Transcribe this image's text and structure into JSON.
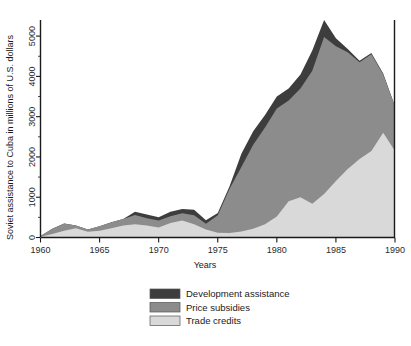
{
  "chart_data": {
    "type": "area",
    "stacked": true,
    "title": "",
    "xlabel": "Years",
    "ylabel": "Soviet assistance to Cuba in millions of U.S. dollars",
    "xlim": [
      1960,
      1990
    ],
    "ylim": [
      0,
      5400
    ],
    "xticks": [
      1960,
      1965,
      1970,
      1975,
      1980,
      1985,
      1990
    ],
    "xtick_labels": [
      "1960",
      "1965",
      "1970",
      "1975",
      "1980",
      "1985",
      "1990"
    ],
    "yticks": [
      0,
      1000,
      2000,
      3000,
      4000,
      5000
    ],
    "ytick_labels": [
      "0",
      "1000",
      "2000",
      "3000",
      "4000",
      "5000"
    ],
    "y_minor_ticks": [
      500,
      1500,
      2500,
      3500,
      4500
    ],
    "grid": false,
    "legend_position": "below-center",
    "x": [
      1960,
      1961,
      1962,
      1963,
      1964,
      1965,
      1966,
      1967,
      1968,
      1969,
      1970,
      1971,
      1972,
      1973,
      1974,
      1975,
      1976,
      1977,
      1978,
      1979,
      1980,
      1981,
      1982,
      1983,
      1984,
      1985,
      1986,
      1987,
      1988,
      1989,
      1990
    ],
    "series": [
      {
        "name": "Trade credits",
        "color": "#d9d9d9",
        "values": [
          20,
          90,
          170,
          230,
          140,
          170,
          230,
          300,
          330,
          300,
          250,
          360,
          420,
          330,
          200,
          120,
          110,
          150,
          220,
          330,
          520,
          900,
          1000,
          840,
          1080,
          1400,
          1700,
          1950,
          2150,
          2600,
          2150
        ]
      },
      {
        "name": "Price subsidies",
        "color": "#8c8c8c",
        "values": [
          20,
          130,
          180,
          70,
          60,
          110,
          150,
          160,
          230,
          180,
          170,
          170,
          180,
          220,
          140,
          430,
          1100,
          1600,
          2080,
          2400,
          2680,
          2500,
          2700,
          3300,
          3900,
          3350,
          2900,
          2400,
          2400,
          1450,
          1100
        ]
      },
      {
        "name": "Development assistance",
        "color": "#3d3d3d",
        "values": [
          0,
          0,
          0,
          0,
          0,
          0,
          0,
          0,
          80,
          90,
          80,
          110,
          110,
          140,
          90,
          60,
          60,
          330,
          340,
          310,
          300,
          300,
          350,
          500,
          420,
          200,
          80,
          40,
          30,
          20,
          10
        ]
      }
    ],
    "totals_note": "peak total ≈ 5200 in 1984"
  },
  "legend": {
    "items": [
      {
        "label": "Development assistance",
        "color": "#3d3d3d"
      },
      {
        "label": "Price subsidies",
        "color": "#8c8c8c"
      },
      {
        "label": "Trade credits",
        "color": "#d9d9d9"
      }
    ]
  }
}
